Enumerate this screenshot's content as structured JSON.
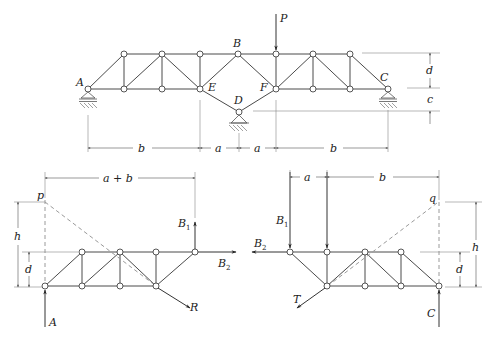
{
  "figure": {
    "type": "truss free-body diagram",
    "colors": {
      "members": "#4a4a4a",
      "dimension": "#555555",
      "dashed": "#9a9a9a",
      "background": "#ffffff"
    }
  },
  "top_truss": {
    "labels": {
      "A": "A",
      "B": "B",
      "C": "C",
      "D": "D",
      "E": "E",
      "F": "F",
      "P": "P"
    },
    "dims": {
      "b_left": "b",
      "a_left": "a",
      "a_right": "a",
      "b_right": "b",
      "d": "d",
      "c": "c"
    }
  },
  "left_fbd": {
    "labels": {
      "p": "p",
      "A": "A",
      "R": "R",
      "B1": "B",
      "B1_sub": "1",
      "B2": "B",
      "B2_sub": "2"
    },
    "dims": {
      "a_plus_b": "a + b",
      "h": "h",
      "d": "d"
    }
  },
  "right_fbd": {
    "labels": {
      "q": "q",
      "C": "C",
      "T": "T",
      "B1": "B",
      "B1_sub": "1",
      "B2": "B",
      "B2_sub": "2"
    },
    "dims": {
      "a": "a",
      "b": "b",
      "h": "h",
      "d": "d"
    }
  }
}
